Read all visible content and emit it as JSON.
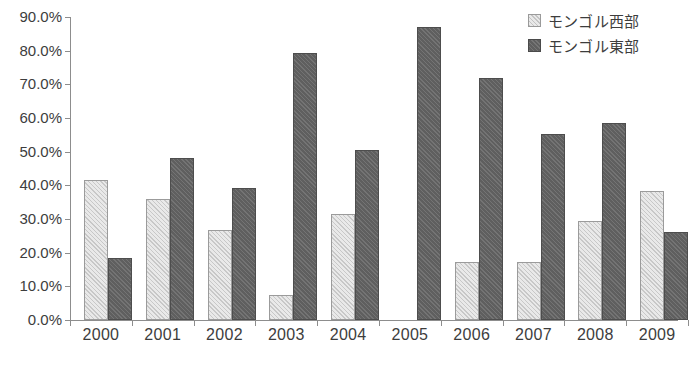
{
  "chart_data": {
    "type": "bar",
    "title": "",
    "xlabel": "",
    "ylabel": "",
    "categories": [
      "2000",
      "2001",
      "2002",
      "2003",
      "2004",
      "2005",
      "2006",
      "2007",
      "2008",
      "2009"
    ],
    "series": [
      {
        "name": "モンゴル西部",
        "color": "#e9e9e9",
        "values": [
          41.6,
          36.0,
          26.8,
          7.5,
          31.6,
          0.0,
          17.2,
          17.3,
          29.5,
          38.4
        ]
      },
      {
        "name": "モンゴル東部",
        "color": "#5f5f5f",
        "values": [
          18.3,
          48.2,
          39.2,
          79.4,
          50.5,
          87.0,
          72.0,
          55.3,
          58.4,
          26.0
        ]
      }
    ],
    "ylim": [
      0,
      90
    ],
    "ytick_values": [
      0,
      10,
      20,
      30,
      40,
      50,
      60,
      70,
      80,
      90
    ],
    "ytick_labels": [
      "0.0%",
      "10.0%",
      "20.0%",
      "30.0%",
      "40.0%",
      "50.0%",
      "60.0%",
      "70.0%",
      "80.0%",
      "90.0%"
    ],
    "grid": false,
    "legend_position": "top-right",
    "units": "percent"
  },
  "legend": {
    "items": [
      {
        "label": "モンゴル西部",
        "swatch": "light-gray-hatched-swatch"
      },
      {
        "label": "モンゴル東部",
        "swatch": "dark-gray-hatched-swatch"
      }
    ]
  }
}
